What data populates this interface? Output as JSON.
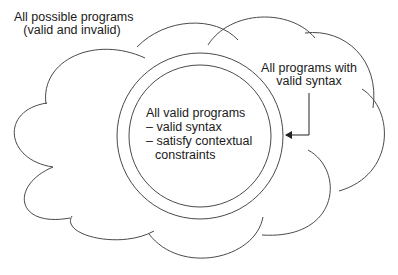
{
  "diagram": {
    "type": "nested-set-diagram",
    "colors": {
      "stroke": "#4a4a4a",
      "text": "#1a1a1a",
      "background": "#ffffff"
    },
    "outer_region": {
      "shape": "cloud",
      "label_line1": "All possible programs",
      "label_line2": "(valid and invalid)"
    },
    "syntax_region": {
      "shape": "circle-outer-ring",
      "label_line1": "All programs with",
      "label_line2": "valid syntax",
      "connector": "arrow-to-outer-circle"
    },
    "valid_region": {
      "shape": "circle-inner",
      "title": "All valid programs",
      "bullet1": "– valid syntax",
      "bullet2": "– satisfy contextual",
      "bullet2_cont": "constraints"
    }
  }
}
